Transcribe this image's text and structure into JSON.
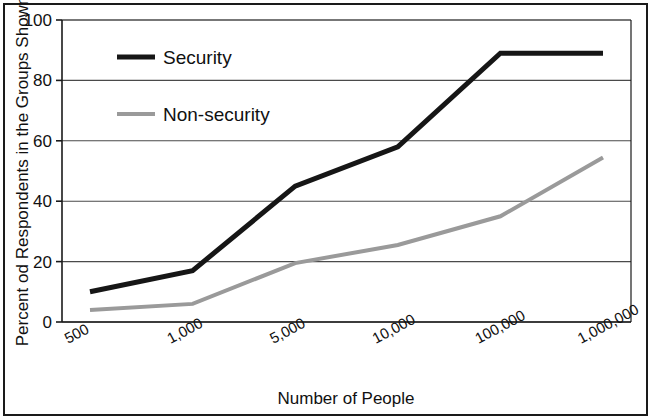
{
  "chart_data": {
    "type": "line",
    "title": "",
    "xlabel": "Number of People",
    "ylabel": "Percent od Respondents in the Groups Shown",
    "categories": [
      "500",
      "1,000",
      "5,000",
      "10,000",
      "100,000",
      "1,000,000"
    ],
    "ylim": [
      0,
      100
    ],
    "yticks": [
      0,
      20,
      40,
      60,
      80,
      100
    ],
    "ytick_labels": [
      "0",
      "20",
      "40",
      "60",
      "80",
      "100"
    ],
    "grid": "horizontal",
    "legend_position": "upper-left-inside",
    "series": [
      {
        "name": "Security",
        "color": "#161616",
        "line_width": 5,
        "values": [
          10,
          17,
          45,
          58,
          89,
          89
        ]
      },
      {
        "name": "Non-security",
        "color": "#9a9a9a",
        "line_width": 4,
        "values": [
          4,
          6,
          19.5,
          25.5,
          35,
          54.5
        ]
      }
    ]
  },
  "axes": {
    "y_label_text": "Percent od Respondents in the Groups Shown",
    "x_label_text": "Number of People"
  },
  "legend": {
    "items": [
      {
        "label": "Security",
        "color": "#161616"
      },
      {
        "label": "Non-security",
        "color": "#9a9a9a"
      }
    ]
  },
  "colors": {
    "frame": "#1a1a1a",
    "gridline": "#4a4a4a",
    "axis": "#1a1a1a",
    "background": "#ffffff",
    "security": "#161616",
    "non_security": "#9a9a9a"
  }
}
